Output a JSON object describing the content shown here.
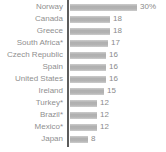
{
  "chart_data": {
    "type": "bar",
    "orientation": "horizontal",
    "title": "",
    "xlabel": "",
    "ylabel": "",
    "grid": false,
    "legend": null,
    "xlim": [
      0,
      30
    ],
    "categories": [
      "Norway",
      "Canada",
      "Greece",
      "South Africa*",
      "Czech Republic",
      "Spain",
      "United States",
      "Ireland",
      "Turkey*",
      "Brazil*",
      "Mexico*",
      "Japan"
    ],
    "values": [
      30,
      18,
      18,
      17,
      16,
      16,
      16,
      15,
      12,
      12,
      12,
      8
    ],
    "value_labels": [
      "30%",
      "18",
      "18",
      "17",
      "16",
      "16",
      "16",
      "15",
      "12",
      "12",
      "12",
      "8"
    ],
    "colors": {
      "bar": "#b5b5b5",
      "axis": "#5c5c5c",
      "category_text": "#8f8f8f",
      "value_text": "#8a8a8a",
      "background": "#ffffff"
    }
  }
}
